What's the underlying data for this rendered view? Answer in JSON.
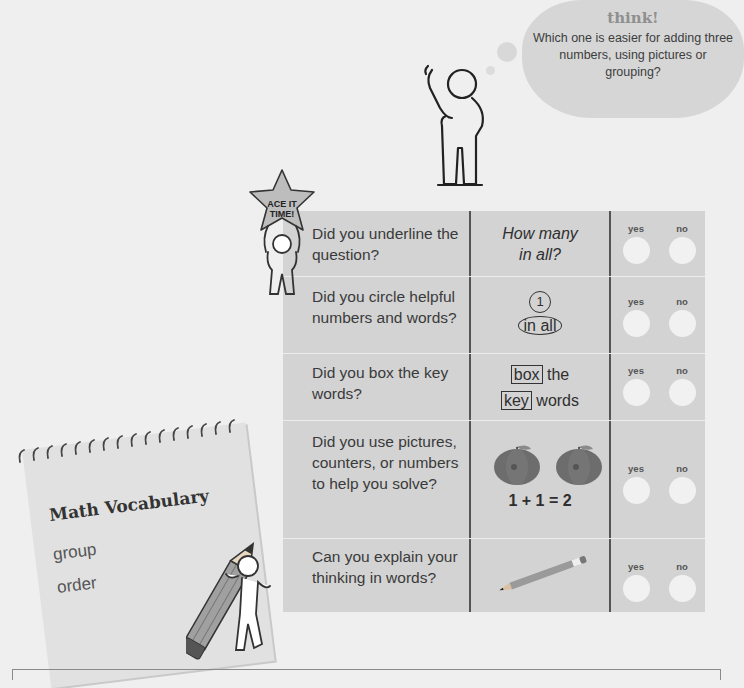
{
  "think_bubble": {
    "title": "think!",
    "text": "Which one is easier for adding three numbers, using pictures or grouping?"
  },
  "badge": {
    "line1": "ACE IT",
    "line2": "TIME!"
  },
  "checklist": {
    "colors": {
      "table_bg": "#d3d3d3",
      "divider": "#555555",
      "circle": "#f1f1f1"
    },
    "rows": [
      {
        "question": "Did you underline the question?",
        "example": {
          "type": "italic-text",
          "lines": [
            "How many",
            "in all?"
          ]
        },
        "yes_label": "yes",
        "no_label": "no"
      },
      {
        "question": "Did you circle helpful numbers and words?",
        "example": {
          "type": "circled",
          "number": "1",
          "phrase": "in all"
        },
        "yes_label": "yes",
        "no_label": "no"
      },
      {
        "question": "Did you box the key words?",
        "example": {
          "type": "boxed",
          "line1_box": "box",
          "line1_rest": "the",
          "line2_box": "key",
          "line2_rest": "words"
        },
        "yes_label": "yes",
        "no_label": "no"
      },
      {
        "question": "Did you use pictures, counters, or numbers to help you solve?",
        "example": {
          "type": "apples",
          "equation": "1 + 1 = 2",
          "icons": [
            "apple-icon",
            "apple-icon"
          ]
        },
        "yes_label": "yes",
        "no_label": "no"
      },
      {
        "question": "Can you explain your thinking in words?",
        "example": {
          "type": "pencil",
          "icon": "pencil-icon"
        },
        "yes_label": "yes",
        "no_label": "no"
      }
    ]
  },
  "vocabulary": {
    "title": "Math Vocabulary",
    "words": [
      "group",
      "order"
    ]
  }
}
